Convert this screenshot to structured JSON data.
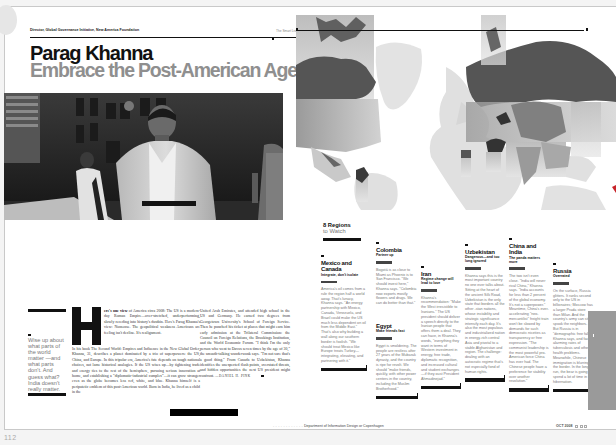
{
  "left_page": {
    "kicker": "Director, Global Governance Initiative, New America Foundation",
    "section_tag": "The Smart List",
    "name": "Parag Khanna",
    "headline": "Embrace the Post-American Age",
    "pull_quote": "Wise up about what parts of the world matter —and what parts don't. And guess what? India doesn't really matter.",
    "dropcap_letter": "H",
    "body": {
      "lead_in": "ere's one view",
      "col1_top": " of America circa 2008: The US is a modern-day Roman Empire—over-stretched, underperforming, slowly receding into history's dustbin. Here's Parag Khanna's view: Nonsense. The geopolitical weakness Americans are feeling isn't decline. It's realignment.",
      "col1_rest": " In his book The Second World: Empires and Influence in the New Global Order, Khanna, 31, describes a planet dominated by a trio of superpowers: the US, China, and Europe. In this tripolar era, America's fate depends on tough national choices, not lame historical analogies. If the US wises up—by tightening trade and energy ties to the rest of the hemisphere, pursuing serious innovation at home, and establishing a \"diplomatic-industrial complex\"—it can grow stronger even as the globe becomes less red, white, and blue. Khanna himself is a peripatetic emblem of this post-American world. Born in India, he lived as a child in the",
      "col2": "United Arab Emirates, and attended high school in the US and Germany. He earned two degrees from Georgetown University's School of Foreign Service. Then he punched his ticket at places that might earn him early admission at the Trilateral Commission: the Council on Foreign Relations, the Brookings Institution, and the World Economic Forum. \"I think I'm the only person who went to Davos seven times by the age of 30,\" the smooth-talking wunderwonk says. \"I'm not sure that's a good thing.\" From Canada to Uzbekistan, Khanna identifies the unexpected flash points, overstated threats, and hidden opportunities the next US president might confront.",
      "byline": "—DANIEL H. PINK"
    },
    "folio": "112"
  },
  "right_page": {
    "map_alt": "World map with highlighted regions",
    "section_title": "8 Regions",
    "section_subtitle": "to Watch",
    "regions": [
      {
        "name": "Mexico and Canada",
        "subtitle": "Integrate, don't isolate",
        "text": "America's oil comes from a rule the region half a world away. That's lunacy, Khanna says. \"An energy partnership with Mexico, Canada, Venezuela, and Brazil could make the US much less dependent on oil from the Middle East.\" That's also why building a wall along our southern border is foolish. \"We should treat Mexico like Europe treats Turkey—integrating, elevating, and partnering with it.\""
      },
      {
        "name": "Colombia",
        "subtitle": "Partner up",
        "text": "Bogotá is as close to Miami as Phoenix is to San Francisco. \"We should invest here,\" Khanna says. \"Colombia now exports mostly flowers and drugs. We can do better than that.\""
      },
      {
        "name": "Egypt",
        "subtitle": "Make friends fast",
        "text": "Egypt is smoldering. The people are restless after 27 years of the Mubarak dynasty, and the country is ripe for revolt. We should \"make friends, quickly, with other power centers in the country, including the Muslim Brotherhood.\""
      },
      {
        "name": "Iran",
        "subtitle": "Regime change will lead to love",
        "text": "Khanna's recommendation: \"Make the West irresistible to Iranians.\" The US president should deliver a speech directly to the Iranian people that offers them a deal. They can have, in Khanna's words, \"everything they want in terms of Western investment in energy, free trade, diplomatic recognition, and increased cultural and student exchanges—if they oust President Ahmadinejad.\""
      },
      {
        "name": "Uzbekistan",
        "subtitle": "Dangerous—and too long ignored",
        "text": "Khanna says this is the most important country no one ever talks about. Sitting at the heart of the ancient Silk Road, Uzbekistan is the only state that borders all the other -stan nations, whose instability and strategic significance intensify each day. It's also the most populous and industrialized nation in energy-rich central Asia and pivotal to a stable Afghanistan and region. The challenge: dealing with an autocratic regime that's not especially fond of human rights."
      },
      {
        "name": "China and India",
        "subtitle": "The panda matters more",
        "text": "The two isn't even close. \"India will never rival China,\" Khanna says. \"India accounts for less than 2 percent of the global economy. It's not a superpower.\" Meantime, China's ever-accelerating \"neo-mercantilist\" freight train won't be slowed by demands for such democratic niceties as transparency or free expression. \"The communist leadership is the most powerful pro-American force China has ever had. The Chinese people have a preference for stability over another revolution.\""
      },
      {
        "name": "Russia",
        "subtitle": "Overrated",
        "text": "On the surface, Russia glitters. It ranks second only to the US in billionaires; Moscow has a larger Prada store than Milan. And the country's army can still spook the neighbors. But Russia is in \"demographic free fall,\" Khanna says, and faces alarming rates of tuberculosis and other health problems. Meanwhile, Chinese immigration is blurring the border. In the long run, the bear is going to spend a lot of time in hibernation."
      }
    ],
    "footer_credit": "Department of Information Design or Copenhagen",
    "footer_issue": "OCT 2008"
  },
  "colors": {
    "ink": "#111111",
    "headline_grey": "#8f8f8f",
    "accent_red": "#c8242a",
    "body_grey": "#777777",
    "map_land": "#d9d9d9",
    "map_dark": "#555555"
  }
}
